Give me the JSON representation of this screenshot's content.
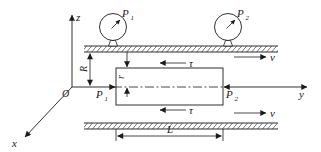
{
  "diagram": {
    "title_hint": "pipe-flow fluid element with pressure gauges",
    "colors": {
      "ink": "#1a1a1a",
      "background": "#ffffff"
    },
    "labels": {
      "axis_z": "z",
      "axis_x": "x",
      "axis_y": "y",
      "origin": "O",
      "gauge1": {
        "base": "P",
        "sub": "1"
      },
      "gauge2": {
        "base": "P",
        "sub": "2"
      },
      "pressure1": {
        "base": "P",
        "sub": "1"
      },
      "pressure2": {
        "base": "P",
        "sub": "2"
      },
      "radius_outer": "R",
      "radius_inner": "r",
      "shear_top": "τ",
      "shear_bottom": "τ",
      "velocity_top": "v",
      "velocity_bottom": "v",
      "length": "L"
    }
  }
}
